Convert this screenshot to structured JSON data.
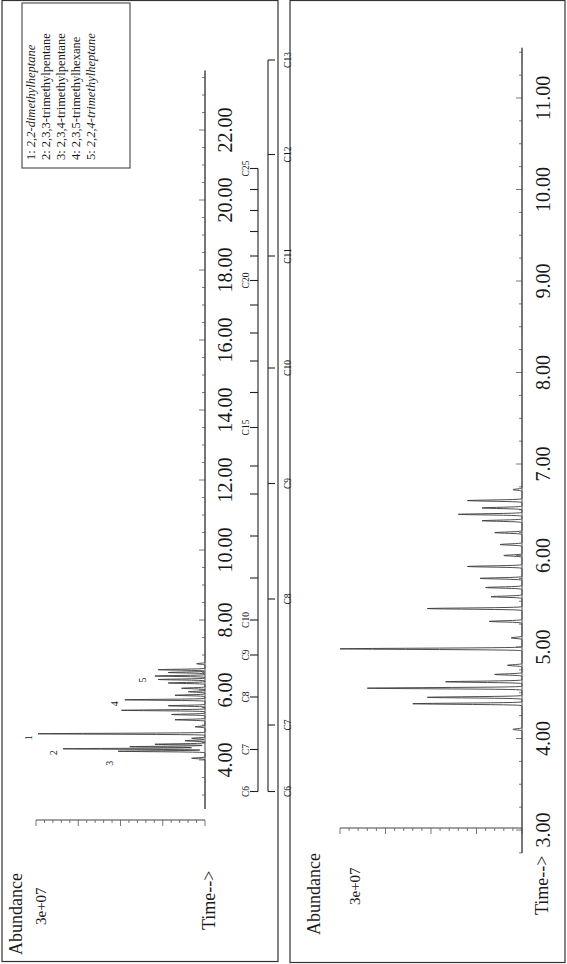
{
  "chart_data": [
    {
      "type": "line",
      "panel": "full-range chromatogram",
      "title": "",
      "xlabel": "Time-->",
      "ylabel": "Abundance",
      "y_tick_label": "3e+07",
      "x_ticks": [
        "4.00",
        "6.00",
        "8.00",
        "10.00",
        "12.00",
        "14.00",
        "16.00",
        "18.00",
        "20.00",
        "22.00"
      ],
      "xlim": [
        2.5,
        23.8
      ],
      "ylim": [
        0,
        34000000.0
      ],
      "grid": false,
      "peak_labels": [
        {
          "label": "1",
          "time": 4.75,
          "abundance": 30000000.0
        },
        {
          "label": "2",
          "time": 4.32,
          "abundance": 25500000.0
        },
        {
          "label": "3",
          "time": 4.25,
          "abundance": 15500000.0
        },
        {
          "label": "4",
          "time": 5.72,
          "abundance": 14500000.0
        },
        {
          "label": "5",
          "time": 6.4,
          "abundance": 9500000.0
        }
      ],
      "legend": {
        "position": "top-right",
        "entries": [
          {
            "num": "1:",
            "name": "2,2-dimethylheptane",
            "italic": true
          },
          {
            "num": "2:",
            "name": "2,3,3-trimethylpentane",
            "italic": false
          },
          {
            "num": "3:",
            "name": "2,3,4-trimethylpentane",
            "italic": false
          },
          {
            "num": "4:",
            "name": "2,3,5-trimethylhexane",
            "italic": false
          },
          {
            "num": "5:",
            "name": "2,2,4-trimethylheptane",
            "italic": true
          }
        ]
      },
      "series": [
        {
          "name": "TIC",
          "peaks": [
            {
              "t": 4.05,
              "h": 0.08
            },
            {
              "t": 4.25,
              "h": 0.52
            },
            {
              "t": 4.32,
              "h": 0.85
            },
            {
              "t": 4.38,
              "h": 0.45
            },
            {
              "t": 4.45,
              "h": 0.3
            },
            {
              "t": 4.55,
              "h": 0.12
            },
            {
              "t": 4.62,
              "h": 0.08
            },
            {
              "t": 4.75,
              "h": 1.0
            },
            {
              "t": 4.95,
              "h": 0.06
            },
            {
              "t": 5.15,
              "h": 0.18
            },
            {
              "t": 5.3,
              "h": 0.2
            },
            {
              "t": 5.42,
              "h": 0.5
            },
            {
              "t": 5.55,
              "h": 0.22
            },
            {
              "t": 5.72,
              "h": 0.48
            },
            {
              "t": 5.85,
              "h": 0.18
            },
            {
              "t": 5.95,
              "h": 0.1
            },
            {
              "t": 6.05,
              "h": 0.14
            },
            {
              "t": 6.2,
              "h": 0.22
            },
            {
              "t": 6.3,
              "h": 0.28
            },
            {
              "t": 6.4,
              "h": 0.3
            },
            {
              "t": 6.5,
              "h": 0.22
            },
            {
              "t": 6.58,
              "h": 0.28
            },
            {
              "t": 6.75,
              "h": 0.05
            }
          ]
        }
      ]
    },
    {
      "type": "line",
      "panel": "expanded chromatogram",
      "title": "",
      "xlabel": "Time-->",
      "ylabel": "Abundance",
      "y_tick_label": "3e+07",
      "x_ticks": [
        "3.00",
        "4.00",
        "5.00",
        "6.00",
        "7.00",
        "8.00",
        "9.00",
        "10.00",
        "11.00"
      ],
      "xlim": [
        2.7,
        11.7
      ],
      "ylim": [
        0,
        34000000.0
      ],
      "grid": false,
      "series": [
        {
          "name": "TIC",
          "peaks": [
            {
              "t": 4.1,
              "h": 0.05
            },
            {
              "t": 4.38,
              "h": 0.6
            },
            {
              "t": 4.45,
              "h": 0.52
            },
            {
              "t": 4.55,
              "h": 0.85
            },
            {
              "t": 4.62,
              "h": 0.42
            },
            {
              "t": 4.7,
              "h": 0.15
            },
            {
              "t": 4.8,
              "h": 0.08
            },
            {
              "t": 4.98,
              "h": 1.0
            },
            {
              "t": 5.1,
              "h": 0.06
            },
            {
              "t": 5.28,
              "h": 0.18
            },
            {
              "t": 5.42,
              "h": 0.52
            },
            {
              "t": 5.55,
              "h": 0.17
            },
            {
              "t": 5.65,
              "h": 0.2
            },
            {
              "t": 5.75,
              "h": 0.23
            },
            {
              "t": 5.88,
              "h": 0.3
            },
            {
              "t": 6.0,
              "h": 0.1
            },
            {
              "t": 6.12,
              "h": 0.12
            },
            {
              "t": 6.25,
              "h": 0.15
            },
            {
              "t": 6.38,
              "h": 0.22
            },
            {
              "t": 6.45,
              "h": 0.35
            },
            {
              "t": 6.52,
              "h": 0.22
            },
            {
              "t": 6.6,
              "h": 0.3
            },
            {
              "t": 6.72,
              "h": 0.05
            }
          ]
        }
      ]
    }
  ],
  "carbon_ladders": {
    "upper": {
      "labels": [
        "C6",
        "C7",
        "C8",
        "C9",
        "C10",
        "C15",
        "C20",
        "C25"
      ],
      "label_times": [
        3.1,
        4.3,
        5.8,
        7.0,
        8.0,
        13.5,
        17.7,
        20.9
      ],
      "tick_times": [
        3.1,
        4.3,
        5.8,
        7.0,
        8.0,
        9.2,
        10.4,
        11.6,
        12.4,
        13.5,
        14.5,
        15.4,
        16.2,
        17.0,
        17.7,
        18.4,
        19.1,
        19.7,
        20.3,
        20.9
      ]
    },
    "lower": {
      "labels": [
        "C6",
        "C7",
        "C8",
        "C9",
        "C10",
        "C11",
        "C12",
        "C13"
      ],
      "label_times": [
        3.1,
        5.0,
        8.6,
        11.9,
        15.2,
        18.4,
        21.3,
        24.0
      ]
    }
  },
  "axes": {
    "abundance_label": "Abundance",
    "y_tick_label": "3e+07",
    "time_label": "Time-->"
  }
}
